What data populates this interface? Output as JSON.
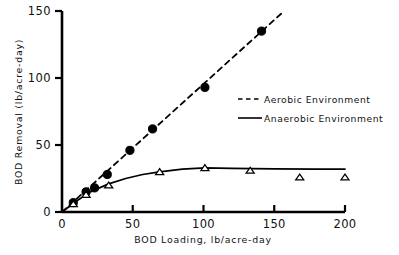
{
  "chart_data": {
    "type": "scatter",
    "title": "",
    "xlabel": "BOD Loading, lb/acre-day",
    "ylabel": "BOD Removal  (lb/acre-day)",
    "xlim": [
      0,
      200
    ],
    "ylim": [
      0,
      150
    ],
    "xticks": [
      0,
      50,
      100,
      150,
      200
    ],
    "yticks": [
      0,
      50,
      100,
      150
    ],
    "xtick_labels": [
      "0",
      "50",
      "100",
      "150",
      "200"
    ],
    "ytick_labels": [
      "0",
      "50",
      "100",
      "150"
    ],
    "grid": false,
    "legend_position": "center-right",
    "series": [
      {
        "name": "Aerobic Environment",
        "linestyle": "dashed",
        "marker": "filled-circle",
        "color": "#000000",
        "points": [
          {
            "x": 8,
            "y": 7
          },
          {
            "x": 17,
            "y": 15
          },
          {
            "x": 23,
            "y": 18
          },
          {
            "x": 32,
            "y": 28
          },
          {
            "x": 48,
            "y": 46
          },
          {
            "x": 64,
            "y": 62
          },
          {
            "x": 101,
            "y": 93
          },
          {
            "x": 141,
            "y": 135
          }
        ],
        "line": [
          {
            "x": 0,
            "y": 0
          },
          {
            "x": 157,
            "y": 150
          }
        ]
      },
      {
        "name": "Anaerobic Environment",
        "linestyle": "solid",
        "marker": "open-triangle",
        "color": "#000000",
        "points": [
          {
            "x": 8,
            "y": 6
          },
          {
            "x": 17,
            "y": 13
          },
          {
            "x": 33,
            "y": 20
          },
          {
            "x": 69,
            "y": 30
          },
          {
            "x": 101,
            "y": 33
          },
          {
            "x": 133,
            "y": 31
          },
          {
            "x": 168,
            "y": 26
          },
          {
            "x": 200,
            "y": 26
          }
        ],
        "line": [
          {
            "x": 0,
            "y": 0
          },
          {
            "x": 10,
            "y": 8
          },
          {
            "x": 20,
            "y": 15
          },
          {
            "x": 33,
            "y": 21
          },
          {
            "x": 45,
            "y": 25
          },
          {
            "x": 57,
            "y": 28
          },
          {
            "x": 69,
            "y": 30
          },
          {
            "x": 85,
            "y": 32
          },
          {
            "x": 101,
            "y": 33
          },
          {
            "x": 120,
            "y": 32.6
          },
          {
            "x": 150,
            "y": 32.2
          },
          {
            "x": 180,
            "y": 32
          },
          {
            "x": 200,
            "y": 32
          }
        ]
      }
    ]
  },
  "legend": {
    "entries": [
      {
        "label": "Aerobic Environment",
        "style": "dashed"
      },
      {
        "label": "Anaerobic Environment",
        "style": "solid"
      }
    ]
  },
  "axes": {
    "x_axis_title": "BOD Loading, lb/acre-day",
    "y_axis_title": "BOD Removal  (lb/acre-day)"
  },
  "colors": {
    "ink": "#000000",
    "background": "#ffffff"
  }
}
